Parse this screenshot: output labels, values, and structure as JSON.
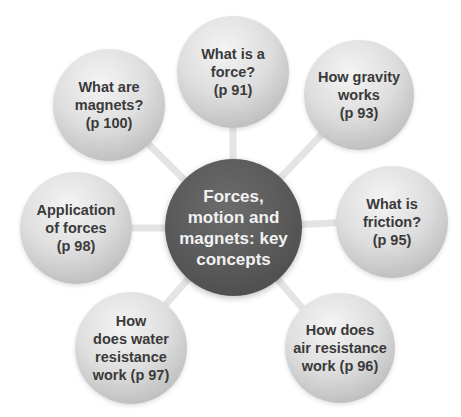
{
  "diagram": {
    "type": "hub-and-spoke concept map",
    "colors": {
      "hub_fill": "#555555",
      "hub_text": "#f2f2f2",
      "node_fill": "#d6d6d6",
      "node_text": "#3a3a3a",
      "connector": "#e6e6e6",
      "background": "#ffffff"
    },
    "center": {
      "label": "Forces,\nmotion and\nmagnets: key\nconcepts"
    },
    "nodes": [
      {
        "id": "force",
        "label": "What is a\nforce?\n(p 91)",
        "page": "p 91"
      },
      {
        "id": "gravity",
        "label": "How gravity\nworks\n(p 93)",
        "page": "p 93"
      },
      {
        "id": "friction",
        "label": "What is\nfriction?\n(p 95)",
        "page": "p 95"
      },
      {
        "id": "air-resistance",
        "label": "How does\nair resistance\nwork (p 96)",
        "page": "p 96"
      },
      {
        "id": "water-resistance",
        "label": "How\ndoes water\nresistance\nwork (p 97)",
        "page": "p 97"
      },
      {
        "id": "application",
        "label": "Application\nof forces\n(p 98)",
        "page": "p 98"
      },
      {
        "id": "magnets",
        "label": "What are\nmagnets?\n(p 100)",
        "page": "p 100"
      }
    ]
  }
}
